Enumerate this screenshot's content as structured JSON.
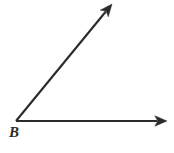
{
  "figure": {
    "kind": "geometry-angle-diagram",
    "background_color": "#ffffff",
    "stroke_color": "#2b2b2b",
    "width": 174,
    "height": 153,
    "vertex": {
      "label": "B",
      "x": 16,
      "y": 121,
      "label_x": 9,
      "label_y": 125
    },
    "rays": [
      {
        "name": "horizontal-ray",
        "from_x": 16,
        "from_y": 121,
        "to_x": 167,
        "to_y": 121,
        "arrowhead": "solid-triangle",
        "direction_degrees": 0
      },
      {
        "name": "diagonal-ray",
        "from_x": 16,
        "from_y": 121,
        "to_x": 112,
        "to_y": 4,
        "arrowhead": "solid-triangle",
        "direction_degrees": 50.6
      }
    ],
    "angle_between_rays_degrees": 50.6
  }
}
